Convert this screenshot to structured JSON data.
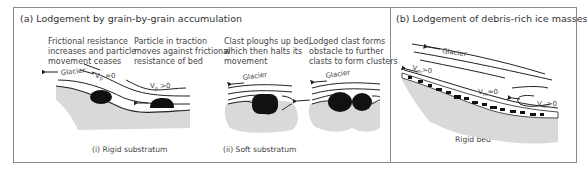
{
  "panel_a": {
    "title": "(a)  Lodgement by grain-by-grain accumulation",
    "captions": [
      {
        "line1": "Frictional resistance",
        "line2": "increases and particle",
        "line3": "movement ceases"
      },
      {
        "line1": "Particle in traction",
        "line2": "moves against frictional",
        "line3": "resistance of bed"
      },
      {
        "line1": "Clast ploughs up bed,",
        "line2": "which then halts its",
        "line3": "movement"
      },
      {
        "line1": "Lodged clast forms",
        "line2": "obstacle to further",
        "line3": "clasts to form clusters"
      }
    ],
    "sub_rigid": "(i) Rigid substratum",
    "sub_soft": "(ii) Soft substratum",
    "labels": {
      "glacier": "Glacier",
      "vp_zero": "V",
      "vp_zero_sub": "p",
      "vp_zero_rel": " =0",
      "vp_pos_rel": " >0"
    }
  },
  "panel_b": {
    "title": "(b)  Lodgement of debris-rich ice masses",
    "glacier": "Glacier",
    "v": "V",
    "v_sub": "m",
    "vm_pos": ">0",
    "vm_zero": "=0",
    "rigid_bed": "Rigid bed"
  },
  "colors": {
    "border": "#8a8a8a",
    "substrate": "#d9d9d9",
    "clast": "#111111",
    "flowline": "#222222",
    "text": "#444444"
  }
}
